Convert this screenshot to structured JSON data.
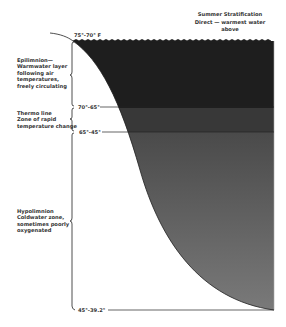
{
  "header": {
    "title": "Summer Stratification",
    "subtitle_line1": "Direct — warmest water",
    "subtitle_line2": "above"
  },
  "zones": [
    {
      "name_line1": "Epilimnion—",
      "name_line2": "Warmwater layer",
      "name_line3": "following air",
      "name_line4": "temperatures,",
      "name_line5": "freely circulating"
    },
    {
      "name_line1": "Thermo line",
      "name_line2": "Zone of rapid",
      "name_line3": "temperature change"
    },
    {
      "name_line1": "Hypolimnion",
      "name_line2": "Coldwater zone,",
      "name_line3": "sometimes poorly",
      "name_line4": "oxygenated"
    }
  ],
  "temperatures": {
    "surface": "75°-70° F",
    "top_thermocline": "70°-65°",
    "bottom_thermocline": "65°-45°",
    "bottom": "45°-39.2°"
  },
  "colors": {
    "epilimnion": "#1e1e1e",
    "thermocline": "#3a3a3a",
    "hypolimnion": "#6e6e6e",
    "line": "#222222"
  }
}
